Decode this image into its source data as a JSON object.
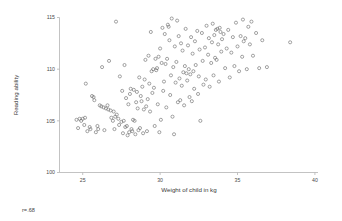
{
  "figure": {
    "background_color": "#ffffff",
    "marker_color": "#6b6b6b",
    "axis_color": "#b4b4b4"
  },
  "annotation": {
    "correlation_label": "r=.68"
  },
  "chart_data": {
    "type": "scatter",
    "title": "",
    "xlabel": "Weight of child in kg",
    "ylabel": "Reading ability",
    "xlim": [
      23.5,
      40.2
    ],
    "ylim": [
      100,
      115
    ],
    "xticks": [
      25,
      30,
      35,
      40
    ],
    "xtick_labels": [
      "25",
      "30",
      "35",
      "40"
    ],
    "yticks": [
      100,
      105,
      110,
      115
    ],
    "ytick_labels": [
      "100",
      "105",
      "110",
      "115"
    ],
    "grid": false,
    "legend": false,
    "marker": "open-circle",
    "correlation": 0.68,
    "n_points": 203,
    "points": [
      [
        24.6,
        105.1
      ],
      [
        24.7,
        104.3
      ],
      [
        24.8,
        105.2
      ],
      [
        24.9,
        105.0
      ],
      [
        25.0,
        105.2
      ],
      [
        25.1,
        104.6
      ],
      [
        25.15,
        105.3
      ],
      [
        25.2,
        108.6
      ],
      [
        25.3,
        104.0
      ],
      [
        25.45,
        104.4
      ],
      [
        25.5,
        104.2
      ],
      [
        25.6,
        107.4
      ],
      [
        25.7,
        107.3
      ],
      [
        25.75,
        107.0
      ],
      [
        25.85,
        103.9
      ],
      [
        25.95,
        104.5
      ],
      [
        26.0,
        104.2
      ],
      [
        26.1,
        106.5
      ],
      [
        26.2,
        106.4
      ],
      [
        26.25,
        110.2
      ],
      [
        26.35,
        106.3
      ],
      [
        26.4,
        104.1
      ],
      [
        26.5,
        106.2
      ],
      [
        26.6,
        106.5
      ],
      [
        26.65,
        106.1
      ],
      [
        26.7,
        110.8
      ],
      [
        26.8,
        106.0
      ],
      [
        26.85,
        105.3
      ],
      [
        26.95,
        105.0
      ],
      [
        27.0,
        105.9
      ],
      [
        27.05,
        104.2
      ],
      [
        27.1,
        105.4
      ],
      [
        27.15,
        114.6
      ],
      [
        27.2,
        105.6
      ],
      [
        27.3,
        105.2
      ],
      [
        27.35,
        104.6
      ],
      [
        27.4,
        109.3
      ],
      [
        27.5,
        104.9
      ],
      [
        27.55,
        107.9
      ],
      [
        27.6,
        103.8
      ],
      [
        27.65,
        105.0
      ],
      [
        27.7,
        110.4
      ],
      [
        27.75,
        104.4
      ],
      [
        27.8,
        107.2
      ],
      [
        27.85,
        104.5
      ],
      [
        27.9,
        103.6
      ],
      [
        27.95,
        106.6
      ],
      [
        28.0,
        103.9
      ],
      [
        28.05,
        107.6
      ],
      [
        28.1,
        108.1
      ],
      [
        28.15,
        104.2
      ],
      [
        28.2,
        104.0
      ],
      [
        28.25,
        105.1
      ],
      [
        28.3,
        108.0
      ],
      [
        28.35,
        105.0
      ],
      [
        28.4,
        103.7
      ],
      [
        28.45,
        106.8
      ],
      [
        28.5,
        107.8
      ],
      [
        28.55,
        106.2
      ],
      [
        28.6,
        104.1
      ],
      [
        28.65,
        109.2
      ],
      [
        28.7,
        104.3
      ],
      [
        28.75,
        107.4
      ],
      [
        28.8,
        106.9
      ],
      [
        28.85,
        108.3
      ],
      [
        28.9,
        103.8
      ],
      [
        28.95,
        106.1
      ],
      [
        29.0,
        109.0
      ],
      [
        29.05,
        110.9
      ],
      [
        29.1,
        106.4
      ],
      [
        29.15,
        104.0
      ],
      [
        29.2,
        107.1
      ],
      [
        29.25,
        111.3
      ],
      [
        29.3,
        108.6
      ],
      [
        29.35,
        105.9
      ],
      [
        29.4,
        113.6
      ],
      [
        29.45,
        109.8
      ],
      [
        29.5,
        107.7
      ],
      [
        29.55,
        110.0
      ],
      [
        29.6,
        108.2
      ],
      [
        29.65,
        104.5
      ],
      [
        29.7,
        111.0
      ],
      [
        29.75,
        109.9
      ],
      [
        29.8,
        110.1
      ],
      [
        29.85,
        106.6
      ],
      [
        29.9,
        111.2
      ],
      [
        29.95,
        103.9
      ],
      [
        30.0,
        112.0
      ],
      [
        30.05,
        105.1
      ],
      [
        30.1,
        110.6
      ],
      [
        30.15,
        114.0
      ],
      [
        30.2,
        107.9
      ],
      [
        30.25,
        108.8
      ],
      [
        30.3,
        113.4
      ],
      [
        30.35,
        110.5
      ],
      [
        30.4,
        106.3
      ],
      [
        30.45,
        111.0
      ],
      [
        30.5,
        114.3
      ],
      [
        30.55,
        114.1
      ],
      [
        30.6,
        112.8
      ],
      [
        30.65,
        107.5
      ],
      [
        30.7,
        109.4
      ],
      [
        30.75,
        114.9
      ],
      [
        30.8,
        105.4
      ],
      [
        30.85,
        110.2
      ],
      [
        30.9,
        103.7
      ],
      [
        30.95,
        112.2
      ],
      [
        31.0,
        108.7
      ],
      [
        31.05,
        110.7
      ],
      [
        31.1,
        114.7
      ],
      [
        31.15,
        106.8
      ],
      [
        31.2,
        113.2
      ],
      [
        31.25,
        109.1
      ],
      [
        31.3,
        107.0
      ],
      [
        31.35,
        112.5
      ],
      [
        31.4,
        108.4
      ],
      [
        31.45,
        111.8
      ],
      [
        31.5,
        109.7
      ],
      [
        31.55,
        106.5
      ],
      [
        31.6,
        110.3
      ],
      [
        31.65,
        113.9
      ],
      [
        31.7,
        109.6
      ],
      [
        31.75,
        108.9
      ],
      [
        31.8,
        112.3
      ],
      [
        31.85,
        110.0
      ],
      [
        31.9,
        107.3
      ],
      [
        31.95,
        109.5
      ],
      [
        32.0,
        113.1
      ],
      [
        32.05,
        106.9
      ],
      [
        32.1,
        111.5
      ],
      [
        32.15,
        109.8
      ],
      [
        32.2,
        108.1
      ],
      [
        32.25,
        112.7
      ],
      [
        32.3,
        110.4
      ],
      [
        32.4,
        113.7
      ],
      [
        32.45,
        107.6
      ],
      [
        32.5,
        109.3
      ],
      [
        32.55,
        111.9
      ],
      [
        32.6,
        105.0
      ],
      [
        32.7,
        113.5
      ],
      [
        32.75,
        110.8
      ],
      [
        32.8,
        108.5
      ],
      [
        32.9,
        112.1
      ],
      [
        32.95,
        109.0
      ],
      [
        33.0,
        114.2
      ],
      [
        33.1,
        111.4
      ],
      [
        33.15,
        113.0
      ],
      [
        33.2,
        108.3
      ],
      [
        33.3,
        110.6
      ],
      [
        33.35,
        112.6
      ],
      [
        33.4,
        114.4
      ],
      [
        33.45,
        109.4
      ],
      [
        33.5,
        113.3
      ],
      [
        33.55,
        111.1
      ],
      [
        33.6,
        113.8
      ],
      [
        33.65,
        110.9
      ],
      [
        33.7,
        113.9
      ],
      [
        33.75,
        112.4
      ],
      [
        33.8,
        108.8
      ],
      [
        33.85,
        114.0
      ],
      [
        33.9,
        113.6
      ],
      [
        33.95,
        111.7
      ],
      [
        34.0,
        112.9
      ],
      [
        34.1,
        113.4
      ],
      [
        34.2,
        110.1
      ],
      [
        34.3,
        112.0
      ],
      [
        34.4,
        113.8
      ],
      [
        34.5,
        109.2
      ],
      [
        34.6,
        111.6
      ],
      [
        34.7,
        113.1
      ],
      [
        34.8,
        110.3
      ],
      [
        34.9,
        114.5
      ],
      [
        35.0,
        112.2
      ],
      [
        35.1,
        109.8
      ],
      [
        35.2,
        113.2
      ],
      [
        35.3,
        111.2
      ],
      [
        35.35,
        114.8
      ],
      [
        35.4,
        112.7
      ],
      [
        35.5,
        113.0
      ],
      [
        35.6,
        110.0
      ],
      [
        35.7,
        114.1
      ],
      [
        35.8,
        112.4
      ],
      [
        35.9,
        114.6
      ],
      [
        36.0,
        111.3
      ],
      [
        36.2,
        113.5
      ],
      [
        36.4,
        110.1
      ],
      [
        36.6,
        112.8
      ],
      [
        36.9,
        110.2
      ],
      [
        38.4,
        112.6
      ]
    ]
  }
}
